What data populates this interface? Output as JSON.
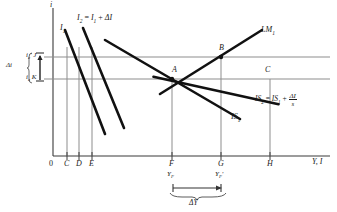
{
  "figure": {
    "type": "diagram",
    "kind": "IS-LM investment multiplier diagram",
    "axes": {
      "y_axis_label": "i",
      "x_axis_label": "Y, I",
      "origin_label": "0"
    },
    "x_ticks": [
      {
        "id": "origin",
        "label": "0",
        "x": 53
      },
      {
        "id": "C",
        "label": "C",
        "x": 67
      },
      {
        "id": "D",
        "label": "D",
        "x": 79
      },
      {
        "id": "E",
        "label": "E",
        "x": 92
      },
      {
        "id": "F",
        "label": "F",
        "x": 172
      },
      {
        "id": "G",
        "label": "G",
        "x": 221
      },
      {
        "id": "H",
        "label": "H",
        "x": 270
      }
    ],
    "interest_levels": [
      {
        "id": "J",
        "rate_label": "i",
        "rate_sub": "e",
        "rate_prime": "'",
        "point_label": "J",
        "y": 57
      },
      {
        "id": "K",
        "rate_label": "i",
        "rate_sub": "e",
        "rate_prime": "",
        "point_label": "K",
        "y": 79
      }
    ],
    "delta_i_label": "Δi",
    "curves": [
      {
        "id": "I1",
        "label_base": "I",
        "label_sub": "1",
        "name": "investment-curve-1"
      },
      {
        "id": "I2",
        "label_full": "I₂ = I₁ + ΔI",
        "name": "investment-curve-2"
      },
      {
        "id": "IS1",
        "label_base": "IS",
        "label_sub": "1",
        "name": "is-curve-1"
      },
      {
        "id": "IS2",
        "label_full": "IS₂ = IS₁ + ΔI/s",
        "name": "is-curve-2"
      },
      {
        "id": "LM1",
        "label_base": "LM",
        "label_sub": "1",
        "name": "lm-curve-1"
      }
    ],
    "equilibrium_points": [
      {
        "label": "A",
        "x": 172,
        "y": 79
      },
      {
        "label": "B",
        "x": 221,
        "y": 57
      },
      {
        "label": "C",
        "x": 270,
        "y": 79
      }
    ],
    "output_labels": {
      "y_f": {
        "base": "Y",
        "sub": "F",
        "prime": ""
      },
      "y_f_prime": {
        "base": "Y",
        "sub": "F",
        "prime": "'"
      }
    },
    "delta_y_label": "ΔY",
    "i2_label": {
      "base": "I",
      "sub": "2",
      "eq": " = ",
      "base2": "I",
      "sub2": "1",
      "plus": " + ",
      "delta": "ΔI"
    },
    "is2_label": {
      "base": "IS",
      "sub": "2",
      "eq": " = ",
      "base2": "IS",
      "sub2": "1",
      "plus": " + ",
      "num": "ΔI",
      "den": "s"
    }
  },
  "colors": {
    "curve": "#111111",
    "axis": "#4a4a4a",
    "guide": "#8a8a8a",
    "text": "#1a1a1a"
  }
}
